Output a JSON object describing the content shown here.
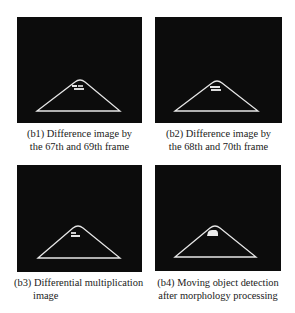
{
  "figure": {
    "panels": [
      {
        "id": "b1",
        "caption_line1": "(b1) Difference image by",
        "caption_line2": "the 67th and 69th frame",
        "triangle": {
          "apex": [
            63,
            63
          ],
          "base_left": [
            20,
            94
          ],
          "base_right": [
            103,
            94
          ]
        },
        "blob": {
          "x": 55,
          "y": 67,
          "w": 13,
          "h": 7
        }
      },
      {
        "id": "b2",
        "caption_line1": "(b2) Difference image by",
        "caption_line2": "the 68th and 70th frame",
        "triangle": {
          "apex": [
            62,
            64
          ],
          "base_left": [
            20,
            94
          ],
          "base_right": [
            103,
            94
          ]
        },
        "blob": {
          "x": 54,
          "y": 68,
          "w": 12,
          "h": 7
        }
      },
      {
        "id": "b3",
        "caption_line1": "(b3) Differential multiplication",
        "caption_line2": "image",
        "triangle": {
          "apex": [
            61,
            61
          ],
          "base_left": [
            21,
            93
          ],
          "base_right": [
            103,
            93
          ]
        },
        "blob": {
          "x": 53,
          "y": 66,
          "w": 10,
          "h": 6
        }
      },
      {
        "id": "b4",
        "caption_line1": "(b4) Moving object detection",
        "caption_line2": "after morphology processing",
        "triangle": {
          "apex": [
            60,
            61
          ],
          "base_left": [
            20,
            92
          ],
          "base_right": [
            101,
            92
          ]
        },
        "blob": {
          "x": 52,
          "y": 65,
          "w": 11,
          "h": 7
        }
      }
    ],
    "colors": {
      "image_background": "#0c0c0c",
      "line": "#e6e6e6",
      "text": "#1a1a1a"
    }
  }
}
